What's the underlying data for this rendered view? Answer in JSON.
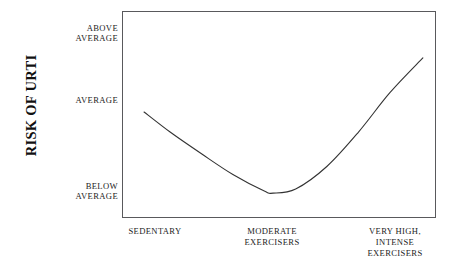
{
  "figure": {
    "background_color": "#ffffff",
    "frame_color": "#59595c",
    "curve_color": "#333333",
    "text_color": "#232323"
  },
  "axes": {
    "y_title": "Risk of URTI",
    "y_ticks": [
      {
        "id": "above-average",
        "lines": [
          "Above",
          "Average"
        ]
      },
      {
        "id": "average",
        "lines": [
          "Average"
        ]
      },
      {
        "id": "below-average",
        "lines": [
          "Below",
          "Average"
        ]
      }
    ],
    "x_ticks": [
      {
        "id": "sedentary",
        "lines": [
          "Sedentary"
        ]
      },
      {
        "id": "moderate-exercisers",
        "lines": [
          "Moderate",
          "Exercisers"
        ]
      },
      {
        "id": "very-high-intense-exercisers",
        "lines": [
          "Very High,",
          "Intense",
          "Exercisers"
        ]
      }
    ]
  },
  "chart_data": {
    "type": "line",
    "title": "",
    "subtitle": "",
    "xlabel": "",
    "ylabel": "Risk of URTI",
    "grid": false,
    "legend": null,
    "annotations": [],
    "x_tick_labels": [
      "Sedentary",
      "Moderate Exercisers",
      "Very High, Intense Exercisers"
    ],
    "y_tick_labels": [
      "Below Average",
      "Average",
      "Above Average"
    ],
    "xlim": [
      0,
      1
    ],
    "ylim": [
      0,
      1
    ],
    "series": [
      {
        "name": "Risk of URTI",
        "color": "#333333",
        "x": [
          0.067,
          0.15,
          0.25,
          0.35,
          0.45,
          0.478,
          0.55,
          0.65,
          0.75,
          0.85,
          0.955
        ],
        "y": [
          0.517,
          0.42,
          0.315,
          0.215,
          0.135,
          0.125,
          0.145,
          0.255,
          0.42,
          0.61,
          0.778
        ],
        "x_category_values": [
          0.1,
          0.478,
          0.87
        ],
        "y_category_values": {
          "below_average": 0.125,
          "average": 0.517,
          "above_average": 0.905
        },
        "points_labelled": [
          {
            "x_label": "Sedentary",
            "y_label": "Average",
            "y_value": 0.517
          },
          {
            "x_label": "Moderate Exercisers",
            "y_label": "Below Average",
            "y_value": 0.125
          },
          {
            "x_label": "Very High, Intense Exercisers",
            "y_label": "Between Average and Above Average",
            "y_value": 0.778
          }
        ]
      }
    ]
  }
}
